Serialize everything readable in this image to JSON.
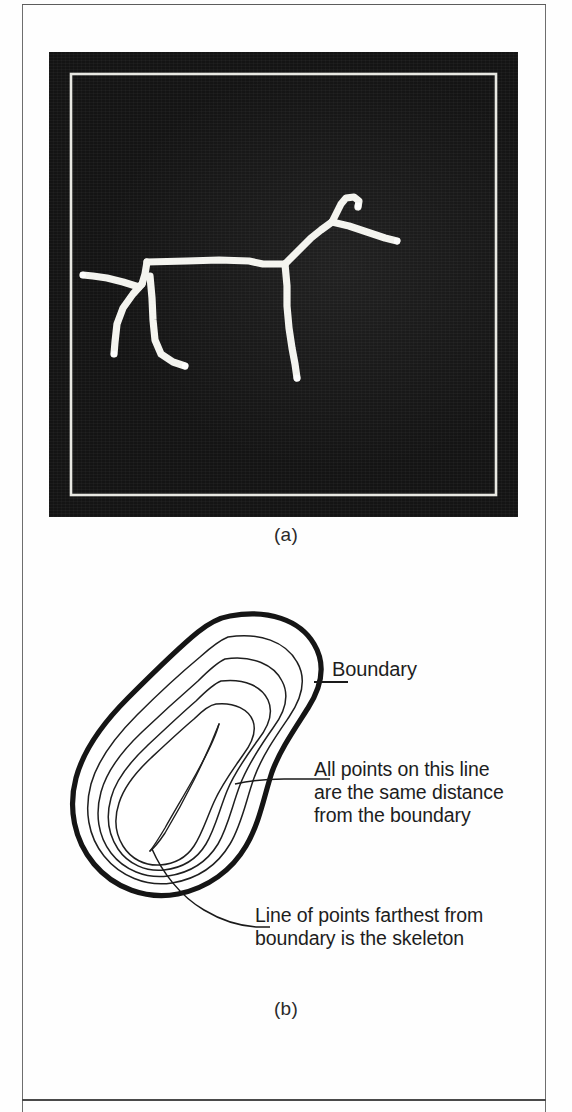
{
  "page": {
    "background_color": "#ffffff",
    "rule_color": "#5d5d5d"
  },
  "figure": {
    "panel_a": {
      "caption": "(a)",
      "type": "photograph",
      "background_color": "#141414",
      "stroke_color": "#f2f2ee",
      "subject": "skeleton of a four-legged animal (dog/horse) on a dark background",
      "inner_frame": true
    },
    "panel_b": {
      "caption": "(b)",
      "type": "line-diagram",
      "stroke_color": "#1a1a1a",
      "boundary_stroke_width": 5,
      "contour_stroke_width": 1.4,
      "contour_count": 4,
      "labels": [
        {
          "name": "boundary",
          "text": "Boundary"
        },
        {
          "name": "equidistant",
          "text": "All points on this line\nare the same distance\nfrom the boundary"
        },
        {
          "name": "skeleton",
          "text": "Line of points farthest from\nboundary is the skeleton"
        }
      ]
    }
  }
}
